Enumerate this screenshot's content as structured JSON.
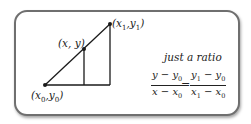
{
  "diagram": {
    "points": {
      "start": {
        "label_main": "(x",
        "sub1": "0",
        "mid": ",y",
        "sub2": "0",
        "end": ")"
      },
      "middle": {
        "label": "(x, y)"
      },
      "end": {
        "label_main": "(x",
        "sub1": "1",
        "mid": ",y",
        "sub2": "1",
        "end": ")"
      }
    },
    "caption": "just a ratio",
    "equation": {
      "left": {
        "num_a": "y − y",
        "num_a_sub": "0",
        "den_a": "x − x",
        "den_a_sub": "0"
      },
      "equals": "=",
      "right": {
        "num_a": "y",
        "num_a_sub": "1",
        "num_b": " − y",
        "num_b_sub": "0",
        "den_a": "x",
        "den_a_sub": "1",
        "den_b": " − x",
        "den_b_sub": "0"
      }
    },
    "colors": {
      "border": "#6f6f6f",
      "line": "#1a1a1a"
    }
  }
}
